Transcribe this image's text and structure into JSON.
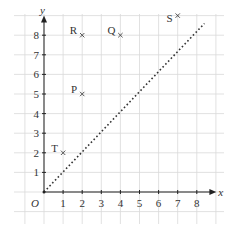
{
  "chart_data": {
    "type": "scatter",
    "title": "",
    "xlabel": "x",
    "ylabel": "y",
    "origin_label": "O",
    "xlim": [
      0,
      8.5
    ],
    "ylim": [
      0,
      8.5
    ],
    "grid": true,
    "x_ticks": [
      "1",
      "2",
      "3",
      "4",
      "5",
      "6",
      "7",
      "8"
    ],
    "y_ticks": [
      "1",
      "2",
      "3",
      "4",
      "5",
      "6",
      "7",
      "8"
    ],
    "points": [
      {
        "label": "P",
        "x": 2,
        "y": 5
      },
      {
        "label": "Q",
        "x": 4,
        "y": 8
      },
      {
        "label": "R",
        "x": 2,
        "y": 8
      },
      {
        "label": "S",
        "x": 7,
        "y": 9
      },
      {
        "label": "T",
        "x": 1,
        "y": 2
      }
    ],
    "lines": [
      {
        "name": "y = x",
        "style": "dotted",
        "from": [
          0,
          0
        ],
        "to": [
          8.4,
          8.6
        ]
      }
    ]
  }
}
